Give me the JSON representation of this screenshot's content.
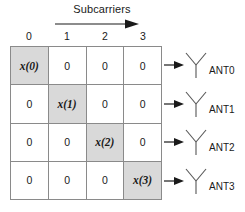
{
  "figure": {
    "title": "Subcarriers",
    "direction_arrow": "right-arrow-icon"
  },
  "grid": {
    "column_headers": [
      "0",
      "1",
      "2",
      "3"
    ],
    "zero_label": "0",
    "rows": [
      {
        "cells": [
          {
            "text": "x(0)",
            "active": true
          },
          {
            "text": "0",
            "active": false
          },
          {
            "text": "0",
            "active": false
          },
          {
            "text": "0",
            "active": false
          }
        ]
      },
      {
        "cells": [
          {
            "text": "0",
            "active": false
          },
          {
            "text": "x(1)",
            "active": true
          },
          {
            "text": "0",
            "active": false
          },
          {
            "text": "0",
            "active": false
          }
        ]
      },
      {
        "cells": [
          {
            "text": "0",
            "active": false
          },
          {
            "text": "0",
            "active": false
          },
          {
            "text": "x(2)",
            "active": true
          },
          {
            "text": "0",
            "active": false
          }
        ]
      },
      {
        "cells": [
          {
            "text": "0",
            "active": false
          },
          {
            "text": "0",
            "active": false
          },
          {
            "text": "0",
            "active": false
          },
          {
            "text": "x(3)",
            "active": true
          }
        ]
      }
    ]
  },
  "antennas": [
    {
      "label": "ANT0",
      "icon": "antenna-icon",
      "arrow": "arrow-icon"
    },
    {
      "label": "ANT1",
      "icon": "antenna-icon",
      "arrow": "arrow-icon"
    },
    {
      "label": "ANT2",
      "icon": "antenna-icon",
      "arrow": "arrow-icon"
    },
    {
      "label": "ANT3",
      "icon": "antenna-icon",
      "arrow": "arrow-icon"
    }
  ],
  "colors": {
    "active_cell_fill": "#d9d9d9",
    "cell_fill": "#ffffff",
    "border": "#8a8a8a",
    "text": "#1a1a1a",
    "background": "#ffffff"
  }
}
